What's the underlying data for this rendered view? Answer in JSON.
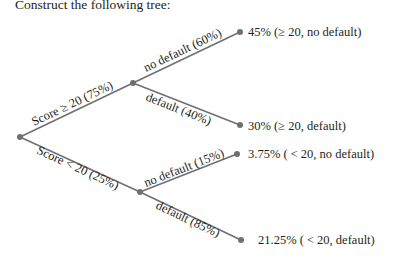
{
  "heading": "Construct the following tree:",
  "tree": {
    "root": {
      "branches": [
        {
          "label": "Score ≥ 20 (75%)",
          "children": [
            {
              "label": "no default (60%)",
              "leaf": "45% (≥ 20, no default)"
            },
            {
              "label": "default (40%)",
              "leaf": "30% (≥ 20, default)"
            }
          ]
        },
        {
          "label": "Score < 20 (25%)",
          "children": [
            {
              "label": "no default (15%)",
              "leaf": "3.75% ( < 20, no default)"
            },
            {
              "label": "default (85%)",
              "leaf": "21.25% ( < 20, default)"
            }
          ]
        }
      ]
    }
  },
  "colors": {
    "line": "#707070",
    "text": "#231f20",
    "background": "#ffffff"
  }
}
